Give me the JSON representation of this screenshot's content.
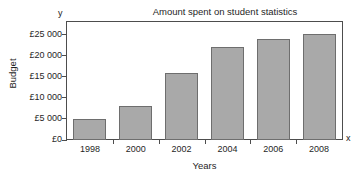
{
  "chart_data": {
    "type": "bar",
    "title": "Amount spent on student statistics",
    "xlabel": "Years",
    "ylabel": "Budget",
    "x_axis_letter": "x",
    "y_axis_letter": "y",
    "categories": [
      "1998",
      "2000",
      "2002",
      "2004",
      "2006",
      "2008"
    ],
    "values": [
      5000,
      8000,
      16000,
      22000,
      24000,
      25200
    ],
    "ylim": [
      0,
      28000
    ],
    "ytick_values": [
      0,
      5000,
      10000,
      15000,
      20000,
      25000
    ],
    "ytick_labels": [
      "£0",
      "£5 000",
      "£10 000",
      "£15 000",
      "£20 000",
      "£25 000"
    ],
    "grid": false,
    "legend": "none",
    "bar_color": "#a9a9a9",
    "bar_edge_color": "#6e6e6e",
    "axis_color": "#4d4d4d",
    "background_color": "#ffffff"
  }
}
